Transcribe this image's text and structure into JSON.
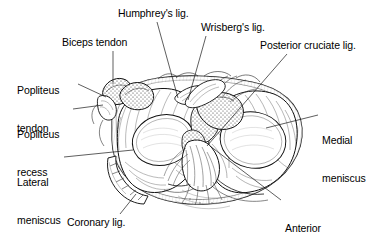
{
  "figure": {
    "background_color": "#ffffff",
    "ink_color": "#000000",
    "line_color": "#333333"
  },
  "labels": [
    {
      "id": "humphreys-lig",
      "text": "Humphrey's lig.",
      "lines": [
        "Humphrey's lig."
      ],
      "x": 118,
      "y": 7,
      "align": "left",
      "leader": [
        [
          157,
          22
        ],
        [
          178,
          98
        ]
      ]
    },
    {
      "id": "wrisbergs-lig",
      "text": "Wrisberg's lig.",
      "lines": [
        "Wrisberg's lig."
      ],
      "x": 201,
      "y": 21,
      "align": "left",
      "leader": [
        [
          206,
          36
        ],
        [
          186,
          100
        ]
      ]
    },
    {
      "id": "posterior-cruciate-lig",
      "text": "Posterior cruciate lig.",
      "lines": [
        "Posterior cruciate lig."
      ],
      "x": 260,
      "y": 39,
      "align": "left",
      "leader": [
        [
          287,
          54
        ],
        [
          207,
          146
        ]
      ]
    },
    {
      "id": "biceps-tendon",
      "text": "Biceps tendon",
      "lines": [
        "Biceps tendon"
      ],
      "x": 62,
      "y": 36,
      "align": "left",
      "leader": [
        [
          113,
          51
        ],
        [
          113,
          85
        ]
      ]
    },
    {
      "id": "popliteus-tendon",
      "text": "Popliteus tendon",
      "lines": [
        "Popliteus",
        "tendon"
      ],
      "x": 17,
      "y": 59,
      "align": "left",
      "leader": [
        [
          78,
          84
        ],
        [
          104,
          97
        ]
      ]
    },
    {
      "id": "popliteus-recess",
      "text": "Popliteus recess",
      "lines": [
        "Popliteus",
        "recess"
      ],
      "x": 17,
      "y": 103,
      "align": "left",
      "leader": [
        [
          73,
          109
        ],
        [
          105,
          105
        ]
      ]
    },
    {
      "id": "lateral-meniscus",
      "text": "Lateral meniscus",
      "lines": [
        "Lateral",
        "meniscus"
      ],
      "x": 17,
      "y": 151,
      "align": "left",
      "leader": [
        [
          64,
          157
        ],
        [
          131,
          150
        ]
      ]
    },
    {
      "id": "coronary-lig",
      "text": "Coronary lig.",
      "lines": [
        "Coronary lig."
      ],
      "x": 67,
      "y": 216,
      "align": "left",
      "leader": [
        [
          120,
          214
        ],
        [
          135,
          193
        ]
      ]
    },
    {
      "id": "medial-meniscus",
      "text": "Medial meniscus",
      "lines": [
        "Medial",
        "meniscus"
      ],
      "x": 322,
      "y": 109,
      "align": "left",
      "leader": [
        [
          318,
          115
        ],
        [
          268,
          128
        ]
      ]
    },
    {
      "id": "anterior-cruciate-lig",
      "text": "Anterior cruciate lig.",
      "lines": [
        "Anterior",
        "cruciate lig."
      ],
      "x": 285,
      "y": 197,
      "align": "left",
      "leader": [
        [
          281,
          200
        ],
        [
          210,
          145
        ]
      ]
    }
  ],
  "structures": [
    {
      "id": "lateral-meniscus-body",
      "name": "Lateral meniscus"
    },
    {
      "id": "medial-meniscus-body",
      "name": "Medial meniscus"
    },
    {
      "id": "anterior-cruciate-ligament",
      "name": "Anterior cruciate ligament"
    },
    {
      "id": "posterior-cruciate-ligament",
      "name": "Posterior cruciate ligament"
    },
    {
      "id": "humphrey-ligament",
      "name": "Ligament of Humphrey"
    },
    {
      "id": "wrisberg-ligament",
      "name": "Ligament of Wrisberg"
    },
    {
      "id": "biceps-tendon-structure",
      "name": "Biceps femoris tendon"
    },
    {
      "id": "popliteus-tendon-structure",
      "name": "Popliteus tendon"
    },
    {
      "id": "popliteus-recess-structure",
      "name": "Popliteus recess"
    },
    {
      "id": "coronary-ligament-structure",
      "name": "Coronary ligament"
    },
    {
      "id": "tibial-plateau-rim",
      "name": "Tibial plateau rim"
    }
  ]
}
